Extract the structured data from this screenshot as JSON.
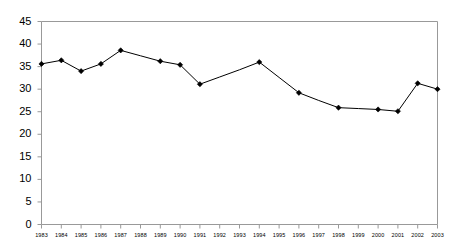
{
  "chart_data": {
    "type": "line",
    "title": "",
    "subtitle": "",
    "xlabel": "",
    "ylabel": "",
    "grid": false,
    "legend": "none",
    "axis_color": "#999999",
    "line_color": "#000000",
    "marker_color": "#000000",
    "marker_shape": "diamond",
    "background": "#ffffff",
    "xlim": [
      1983,
      2003
    ],
    "ylim": [
      0,
      45
    ],
    "ytick_step": 5,
    "ytick_labels": [
      "45",
      "40",
      "35",
      "30",
      "25",
      "20",
      "15",
      "10",
      "5",
      "0"
    ],
    "ytick_values": [
      45,
      40,
      35,
      30,
      25,
      20,
      15,
      10,
      5,
      0
    ],
    "categories": [
      "1983",
      "1984",
      "1985",
      "1986",
      "1987",
      "1988",
      "1989",
      "1990",
      "1991",
      "1992",
      "1993",
      "1994",
      "1995",
      "1996",
      "1997",
      "1998",
      "1999",
      "2000",
      "2001",
      "2002",
      "2003"
    ],
    "x": [
      1983,
      1984,
      1985,
      1986,
      1987,
      1988,
      1989,
      1990,
      1991,
      1992,
      1993,
      1994,
      1995,
      1996,
      1997,
      1998,
      1999,
      2000,
      2001,
      2002,
      2003
    ],
    "values": [
      35.6,
      36.4,
      34.0,
      35.6,
      38.6,
      37.4,
      36.2,
      35.4,
      31.1,
      32.7,
      34.3,
      36.0,
      32.6,
      29.2,
      27.5,
      25.9,
      25.7,
      25.5,
      25.1,
      31.3,
      30.0
    ],
    "marker_years": [
      1983,
      1984,
      1985,
      1986,
      1987,
      1989,
      1990,
      1991,
      1994,
      1996,
      1998,
      2000,
      2001,
      2002,
      2003
    ],
    "series": [
      {
        "name": "series-1",
        "values": [
          35.6,
          36.4,
          34.0,
          35.6,
          38.6,
          37.4,
          36.2,
          35.4,
          31.1,
          32.7,
          34.3,
          36.0,
          32.6,
          29.2,
          27.5,
          25.9,
          25.7,
          25.5,
          25.1,
          31.3,
          30.0
        ]
      }
    ]
  }
}
